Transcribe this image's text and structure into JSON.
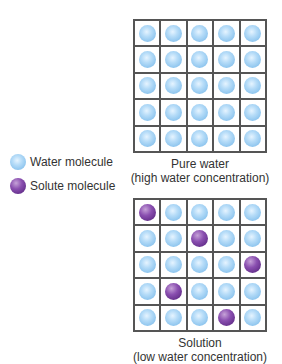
{
  "legend": {
    "water_label": "Water molecule",
    "solute_label": "Solute molecule"
  },
  "pure_water": {
    "caption_line1": "Pure water",
    "caption_line2": "(high water concentration)",
    "grid": [
      [
        "W",
        "W",
        "W",
        "W",
        "W"
      ],
      [
        "W",
        "W",
        "W",
        "W",
        "W"
      ],
      [
        "W",
        "W",
        "W",
        "W",
        "W"
      ],
      [
        "W",
        "W",
        "W",
        "W",
        "W"
      ],
      [
        "W",
        "W",
        "W",
        "W",
        "W"
      ]
    ]
  },
  "solution": {
    "caption_line1": "Solution",
    "caption_line2": "(low water concentration)",
    "grid": [
      [
        "S",
        "W",
        "W",
        "W",
        "W"
      ],
      [
        "W",
        "W",
        "S",
        "W",
        "W"
      ],
      [
        "W",
        "W",
        "W",
        "W",
        "S"
      ],
      [
        "W",
        "S",
        "W",
        "W",
        "W"
      ],
      [
        "W",
        "W",
        "W",
        "S",
        "W"
      ]
    ]
  },
  "colors": {
    "water": "#8cc4ee",
    "solute": "#6a3590",
    "grid_line": "#555555"
  }
}
